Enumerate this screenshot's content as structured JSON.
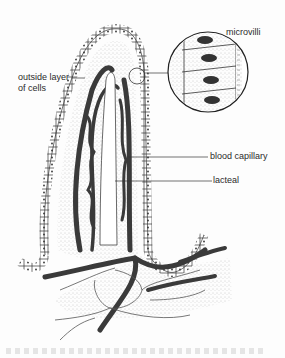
{
  "figure": {
    "labels": {
      "microvilli": "microvilli",
      "outside_layer_line1": "outside layer",
      "outside_layer_line2": "of cells",
      "blood_capillary": "blood capillary",
      "lacteal": "lacteal"
    },
    "colors": {
      "ink": "#2b2b2b",
      "stipple": "#9a9a9a",
      "capillary": "#3a3a3a",
      "background": "#fdfdfd"
    }
  }
}
